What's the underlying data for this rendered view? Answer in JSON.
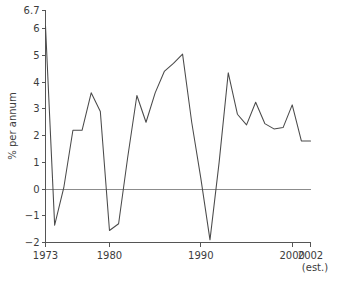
{
  "chart_data": {
    "type": "line",
    "title": "",
    "subtitle": "",
    "xlabel": "",
    "ylabel": "% per annum",
    "xlim": [
      1973,
      2002
    ],
    "ylim": [
      -2,
      6.7
    ],
    "grid": false,
    "legend": null,
    "legend_position": "none",
    "zero_line": true,
    "x_tick_labels": [
      "1973",
      "1980",
      "1990",
      "2000",
      "2002"
    ],
    "x_tick_values": [
      1973,
      1980,
      1990,
      2000,
      2002
    ],
    "y_tick_labels": [
      "6.7",
      "6",
      "5",
      "4",
      "3",
      "2",
      "1",
      "0",
      "-1",
      "-2"
    ],
    "y_tick_values": [
      6.7,
      6,
      5,
      4,
      3,
      2,
      1,
      0,
      -1,
      -2
    ],
    "annotations": [
      "(est.)"
    ],
    "x": [
      1973,
      1974,
      1975,
      1976,
      1977,
      1978,
      1979,
      1980,
      1981,
      1982,
      1983,
      1984,
      1985,
      1986,
      1987,
      1988,
      1989,
      1990,
      1991,
      1992,
      1993,
      1994,
      1995,
      1996,
      1997,
      1998,
      1999,
      2000,
      2001,
      2002
    ],
    "series": [
      {
        "name": "% per annum",
        "color": "#4a4a4a",
        "values": [
          6.1,
          -1.35,
          0.05,
          2.2,
          2.2,
          3.6,
          2.9,
          -1.55,
          -1.3,
          1.2,
          3.5,
          2.5,
          3.6,
          4.4,
          4.7,
          5.05,
          2.5,
          0.4,
          -1.9,
          1.0,
          4.35,
          2.8,
          2.4,
          3.25,
          2.45,
          2.25,
          2.3,
          3.15,
          1.8,
          1.8
        ]
      }
    ]
  },
  "axes": {
    "y_title": "% per annum",
    "x_note": "(est.)"
  }
}
